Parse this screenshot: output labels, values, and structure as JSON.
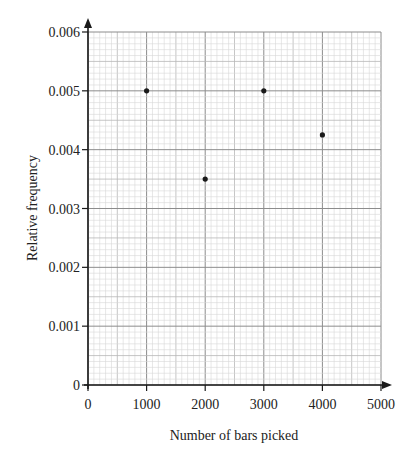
{
  "chart_data": {
    "type": "scatter",
    "title": "",
    "xlabel": "Number of bars picked",
    "ylabel": "Relative frequency",
    "xlim": [
      0,
      5000
    ],
    "ylim": [
      0,
      0.006
    ],
    "x_ticks": [
      0,
      1000,
      2000,
      3000,
      4000,
      5000
    ],
    "x_tick_labels": [
      "0",
      "1000",
      "2000",
      "3000",
      "4000",
      "5000"
    ],
    "y_ticks": [
      0,
      0.001,
      0.002,
      0.003,
      0.004,
      0.005,
      0.006
    ],
    "y_tick_labels": [
      "0",
      "0.001",
      "0.002",
      "0.003",
      "0.004",
      "0.005",
      "0.006"
    ],
    "grid": true,
    "grid_minor_x_step": 100,
    "grid_minor_y_step": 0.0001,
    "legend": null,
    "series": [
      {
        "name": "Relative frequency",
        "points": [
          {
            "x": 1000,
            "y": 0.005
          },
          {
            "x": 2000,
            "y": 0.0035
          },
          {
            "x": 3000,
            "y": 0.005
          },
          {
            "x": 4000,
            "y": 0.00425
          }
        ]
      }
    ]
  },
  "colors": {
    "minor_grid": "#d6d6d6",
    "mid_grid": "#b8b8b8",
    "major_grid": "#8c8c8c",
    "axis": "#1a1a1a",
    "point": "#1a1a1a"
  }
}
